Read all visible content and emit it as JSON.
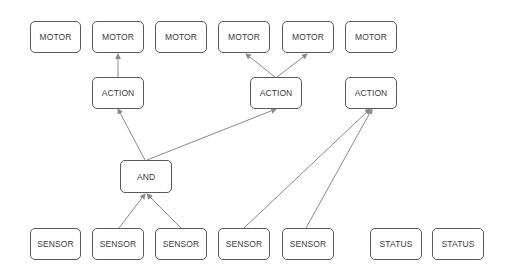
{
  "diagram": {
    "title": "",
    "colors": {
      "node_border": "#5a5a5a",
      "node_text": "#3a3a3a",
      "edge": "#8a8a8a",
      "background": "#ffffff"
    },
    "nodes": [
      {
        "id": "motor1",
        "label": "MOTOR",
        "type": "motor",
        "x": 30,
        "y": 21,
        "w": 51,
        "h": 32
      },
      {
        "id": "motor2",
        "label": "MOTOR",
        "type": "motor",
        "x": 92,
        "y": 21,
        "w": 52,
        "h": 32
      },
      {
        "id": "motor3",
        "label": "MOTOR",
        "type": "motor",
        "x": 155,
        "y": 21,
        "w": 52,
        "h": 32
      },
      {
        "id": "motor4",
        "label": "MOTOR",
        "type": "motor",
        "x": 218,
        "y": 21,
        "w": 52,
        "h": 32
      },
      {
        "id": "motor5",
        "label": "MOTOR",
        "type": "motor",
        "x": 282,
        "y": 21,
        "w": 52,
        "h": 32
      },
      {
        "id": "motor6",
        "label": "MOTOR",
        "type": "motor",
        "x": 345,
        "y": 21,
        "w": 52,
        "h": 32
      },
      {
        "id": "action1",
        "label": "ACTION",
        "type": "action",
        "x": 92,
        "y": 77,
        "w": 52,
        "h": 32
      },
      {
        "id": "action2",
        "label": "ACTION",
        "type": "action",
        "x": 250,
        "y": 77,
        "w": 52,
        "h": 32
      },
      {
        "id": "action3",
        "label": "ACTION",
        "type": "action",
        "x": 345,
        "y": 77,
        "w": 52,
        "h": 32
      },
      {
        "id": "and1",
        "label": "AND",
        "type": "logic",
        "x": 120,
        "y": 160,
        "w": 52,
        "h": 33
      },
      {
        "id": "sensor1",
        "label": "SENSOR",
        "type": "sensor",
        "x": 30,
        "y": 228,
        "w": 51,
        "h": 32
      },
      {
        "id": "sensor2",
        "label": "SENSOR",
        "type": "sensor",
        "x": 92,
        "y": 228,
        "w": 52,
        "h": 32
      },
      {
        "id": "sensor3",
        "label": "SENSOR",
        "type": "sensor",
        "x": 155,
        "y": 228,
        "w": 52,
        "h": 32
      },
      {
        "id": "sensor4",
        "label": "SENSOR",
        "type": "sensor",
        "x": 218,
        "y": 228,
        "w": 52,
        "h": 32
      },
      {
        "id": "sensor5",
        "label": "SENSOR",
        "type": "sensor",
        "x": 282,
        "y": 228,
        "w": 52,
        "h": 32
      },
      {
        "id": "status1",
        "label": "STATUS",
        "type": "status",
        "x": 370,
        "y": 228,
        "w": 52,
        "h": 32
      },
      {
        "id": "status2",
        "label": "STATUS",
        "type": "status",
        "x": 432,
        "y": 228,
        "w": 52,
        "h": 32
      }
    ],
    "edges": [
      {
        "from": "action1",
        "to": "motor2",
        "x1": 118,
        "y1": 77,
        "x2": 118,
        "y2": 54
      },
      {
        "from": "action2",
        "to": "motor4",
        "x1": 275,
        "y1": 77,
        "x2": 246,
        "y2": 54
      },
      {
        "from": "action2",
        "to": "motor5",
        "x1": 277,
        "y1": 77,
        "x2": 307,
        "y2": 54
      },
      {
        "from": "and1",
        "to": "action1",
        "x1": 145,
        "y1": 160,
        "x2": 118,
        "y2": 109
      },
      {
        "from": "and1",
        "to": "action2",
        "x1": 147,
        "y1": 160,
        "x2": 276,
        "y2": 109
      },
      {
        "from": "sensor2",
        "to": "and1",
        "x1": 119,
        "y1": 228,
        "x2": 145,
        "y2": 194
      },
      {
        "from": "sensor3",
        "to": "and1",
        "x1": 181,
        "y1": 228,
        "x2": 147,
        "y2": 194
      },
      {
        "from": "sensor4",
        "to": "action3",
        "x1": 244,
        "y1": 228,
        "x2": 370,
        "y2": 109
      },
      {
        "from": "sensor5",
        "to": "action3",
        "x1": 306,
        "y1": 228,
        "x2": 372,
        "y2": 109
      }
    ]
  }
}
